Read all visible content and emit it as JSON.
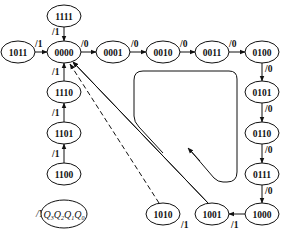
{
  "diagram": {
    "type": "state-transition-diagram",
    "states": [
      "0000",
      "0001",
      "0010",
      "0011",
      "0100",
      "0101",
      "0110",
      "0111",
      "1000",
      "1001",
      "1010",
      "1011",
      "1100",
      "1101",
      "1110",
      "1111"
    ],
    "transitions": [
      {
        "from": "0000",
        "to": "0001",
        "label": "/0"
      },
      {
        "from": "0001",
        "to": "0010",
        "label": "/0"
      },
      {
        "from": "0010",
        "to": "0011",
        "label": "/0"
      },
      {
        "from": "0011",
        "to": "0100",
        "label": "/0"
      },
      {
        "from": "0100",
        "to": "0101",
        "label": "/0"
      },
      {
        "from": "0101",
        "to": "0110",
        "label": "/0"
      },
      {
        "from": "0110",
        "to": "0111",
        "label": "/0"
      },
      {
        "from": "0111",
        "to": "1000",
        "label": "/0"
      },
      {
        "from": "1000",
        "to": "1001",
        "label": "/1"
      },
      {
        "from": "1001",
        "to": "1010",
        "label": "/1"
      },
      {
        "from": "1001",
        "to": "0000",
        "label": ""
      },
      {
        "from": "1010",
        "to": "0000",
        "label": "",
        "style": "dashed"
      },
      {
        "from": "1011",
        "to": "0000",
        "label": "/1"
      },
      {
        "from": "1111",
        "to": "0000",
        "label": "/1"
      },
      {
        "from": "1110",
        "to": "0000",
        "label": "/1"
      },
      {
        "from": "1101",
        "to": "1110",
        "label": "/1"
      },
      {
        "from": "1100",
        "to": "1101",
        "label": "/1"
      }
    ],
    "legend": {
      "prefix": "/Y",
      "state_label": "Q3Q2Q1Q0",
      "bits": [
        "Q",
        "3",
        "Q",
        "2",
        "Q",
        "1",
        "Q",
        "0"
      ]
    },
    "cycle_direction": "counterclockwise"
  }
}
